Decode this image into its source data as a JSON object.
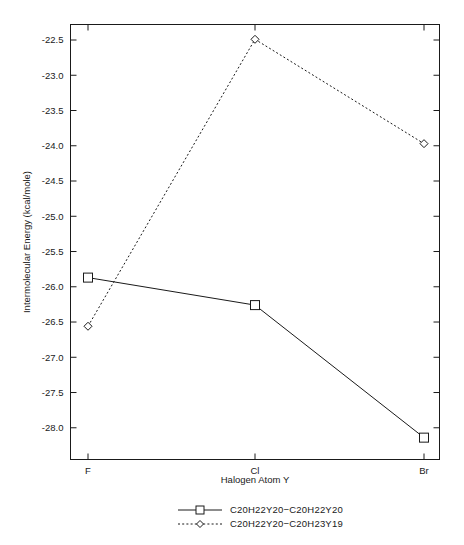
{
  "chart_data": {
    "type": "line",
    "title": "",
    "xlabel": "Halogen Atom Y",
    "ylabel": "Intermolecular Energy (kcal/mole)",
    "categories": [
      "F",
      "Cl",
      "Br"
    ],
    "ylim": [
      -28.45,
      -22.28
    ],
    "yticks": [
      "-22.5",
      "-23.0",
      "-23.5",
      "-24.0",
      "-24.5",
      "-25.0",
      "-25.5",
      "-26.0",
      "-26.5",
      "-27.0",
      "-27.5",
      "-28.0"
    ],
    "ytick_values": [
      -22.5,
      -23.0,
      -23.5,
      -24.0,
      -24.5,
      -25.0,
      -25.5,
      -26.0,
      -26.5,
      -27.0,
      -27.5,
      -28.0
    ],
    "grid": false,
    "legend_position": "below",
    "series": [
      {
        "name": "C20H22Y20−C20H22Y20",
        "values": [
          -25.87,
          -26.26,
          -28.14
        ],
        "marker": "square",
        "linestyle": "solid",
        "color": "#1a1a1a"
      },
      {
        "name": "C20H22Y20−C20H23Y19",
        "values": [
          -26.56,
          -22.49,
          -23.97
        ],
        "marker": "diamond",
        "linestyle": "dotted",
        "color": "#1a1a1a"
      }
    ]
  },
  "axes": {
    "x_title": "Halogen Atom Y",
    "y_title": "Intermolecular Energy (kcal/mole)",
    "x_tick_labels": [
      "F",
      "Cl",
      "Br"
    ],
    "y_tick_labels": [
      "-22.5",
      "-23.0",
      "-23.5",
      "-24.0",
      "-24.5",
      "-25.0",
      "-25.5",
      "-26.0",
      "-26.5",
      "-27.0",
      "-27.5",
      "-28.0"
    ]
  },
  "legend": {
    "entries": [
      {
        "label": "C20H22Y20−C20H22Y20",
        "marker": "square",
        "linestyle": "solid"
      },
      {
        "label": "C20H22Y20−C20H23Y19",
        "marker": "diamond",
        "linestyle": "dotted"
      }
    ]
  },
  "colors": {
    "ink": "#1a1a1a",
    "background": "#ffffff"
  }
}
